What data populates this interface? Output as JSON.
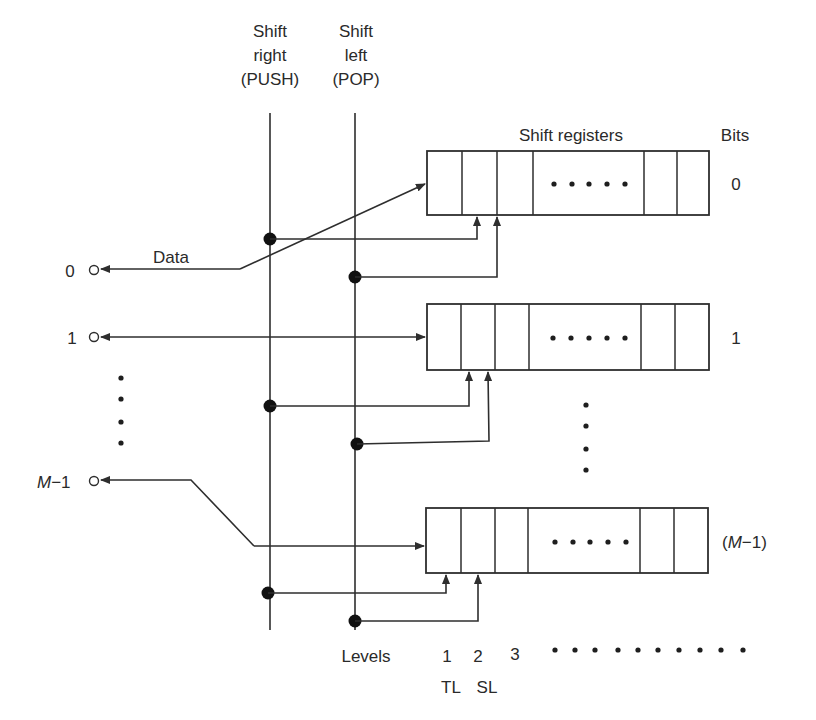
{
  "diagram": {
    "type": "stack shift-register block diagram",
    "control_lines": {
      "push": {
        "line1": "Shift",
        "line2": "right",
        "line3": "(PUSH)"
      },
      "pop": {
        "line1": "Shift",
        "line2": "left",
        "line3": "(POP)"
      }
    },
    "header": {
      "registers_label": "Shift registers",
      "bits_label": "Bits"
    },
    "terminals": [
      {
        "label": "0",
        "data_label": "Data"
      },
      {
        "label": "1"
      },
      {
        "label_prefix": "M",
        "label_suffix": "−1"
      }
    ],
    "registers": [
      {
        "bit_label": "0",
        "ellipsis": "• • • • •"
      },
      {
        "bit_label": "1",
        "ellipsis": "• • • • •"
      },
      {
        "bit_label_open": "(",
        "bit_label_m": "M",
        "bit_label_close": "−1)",
        "ellipsis": "• • • • •"
      }
    ],
    "levels": {
      "label": "Levels",
      "numbers": [
        "1",
        "2",
        "3"
      ],
      "ellipsis_dots": 10,
      "sub_labels": [
        "TL",
        "SL"
      ]
    },
    "colors": {
      "line": "#2e2e2e",
      "background": "#ffffff"
    }
  }
}
